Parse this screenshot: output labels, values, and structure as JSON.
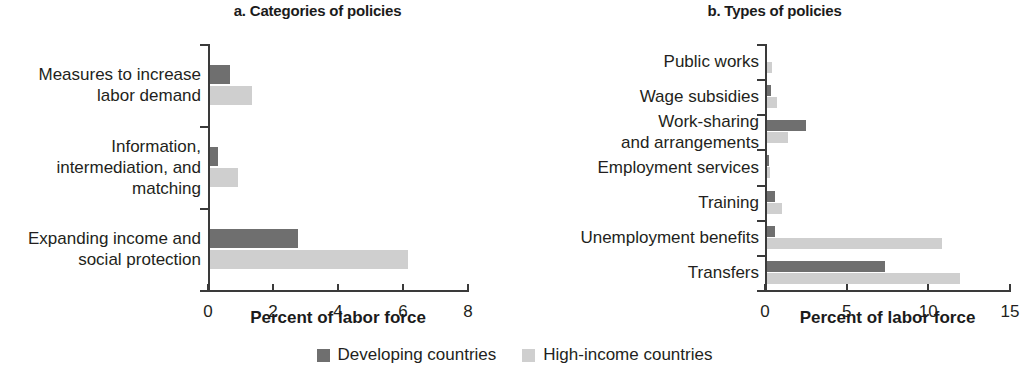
{
  "figure": {
    "legend": [
      {
        "label": "Developing countries",
        "color": "#6f6f6f",
        "key": "developing"
      },
      {
        "label": "High-income countries",
        "color": "#cfcfcf",
        "key": "high_income"
      }
    ]
  },
  "panel_a": {
    "title": "a. Categories of policies",
    "xlabel": "Percent of labor force",
    "xticks": [
      "0",
      "2",
      "4",
      "6",
      "8"
    ],
    "categories": [
      "Measures to increase\nlabor demand",
      "Information,\nintermediation, and\nmatching",
      "Expanding income and\nsocial protection"
    ]
  },
  "panel_b": {
    "title": "b. Types of policies",
    "xlabel": "Percent of labor force",
    "xticks": [
      "0",
      "5",
      "10",
      "15"
    ],
    "categories": [
      "Public works",
      "Wage subsidies",
      "Work-sharing\nand arrangements",
      "Employment services",
      "Training",
      "Unemployment benefits",
      "Transfers"
    ]
  },
  "chart_data": [
    {
      "type": "bar",
      "orientation": "horizontal",
      "title": "a. Categories of policies",
      "xlabel": "Percent of labor force",
      "ylabel": "",
      "xlim": [
        0,
        8
      ],
      "xticks": [
        0,
        2,
        4,
        6,
        8
      ],
      "grid": false,
      "legend_position": "bottom-center-shared",
      "categories": [
        "Measures to increase labor demand",
        "Information, intermediation, and matching",
        "Expanding income and social protection"
      ],
      "series": [
        {
          "name": "Developing countries",
          "color": "#6f6f6f",
          "values": [
            0.6,
            0.25,
            2.7
          ]
        },
        {
          "name": "High-income countries",
          "color": "#cfcfcf",
          "values": [
            1.3,
            0.85,
            6.1
          ]
        }
      ]
    },
    {
      "type": "bar",
      "orientation": "horizontal",
      "title": "b. Types of policies",
      "xlabel": "Percent of labor force",
      "ylabel": "",
      "xlim": [
        0,
        15
      ],
      "xticks": [
        0,
        5,
        10,
        15
      ],
      "grid": false,
      "legend_position": "bottom-center-shared",
      "categories": [
        "Public works",
        "Wage subsidies",
        "Work-sharing and arrangements",
        "Employment services",
        "Training",
        "Unemployment benefits",
        "Transfers"
      ],
      "series": [
        {
          "name": "Developing countries",
          "color": "#6f6f6f",
          "values": [
            0.0,
            0.25,
            2.4,
            0.1,
            0.5,
            0.5,
            7.2
          ]
        },
        {
          "name": "High-income countries",
          "color": "#cfcfcf",
          "values": [
            0.3,
            0.6,
            1.3,
            0.2,
            0.9,
            10.7,
            11.8
          ]
        }
      ]
    }
  ]
}
